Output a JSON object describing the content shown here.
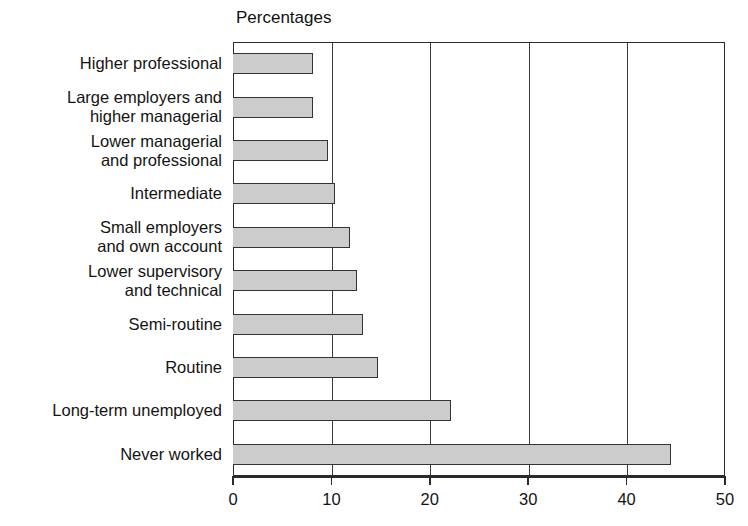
{
  "chart_data": {
    "type": "bar",
    "orientation": "horizontal",
    "title": "Percentages",
    "xlabel": "",
    "ylabel": "",
    "xlim": [
      0,
      50
    ],
    "xticks": [
      0,
      10,
      20,
      30,
      40,
      50
    ],
    "xtick_labels": [
      "0",
      "10",
      "20",
      "30",
      "40",
      "50"
    ],
    "grid": "vertical",
    "legend": "none",
    "bar_fill_color": "#cccccc",
    "bar_border_color": "#333333",
    "axis_color": "#2b2b2b",
    "categories": [
      "Higher professional",
      "Large employers and\nhigher managerial",
      "Lower managerial\nand professional",
      "Intermediate",
      "Small employers\nand own account",
      "Lower supervisory\nand technical",
      "Semi-routine",
      "Routine",
      "Long-term unemployed",
      "Never worked"
    ],
    "values": [
      8.1,
      8.1,
      9.7,
      10.4,
      11.9,
      12.6,
      13.2,
      14.7,
      22.2,
      44.5
    ]
  }
}
